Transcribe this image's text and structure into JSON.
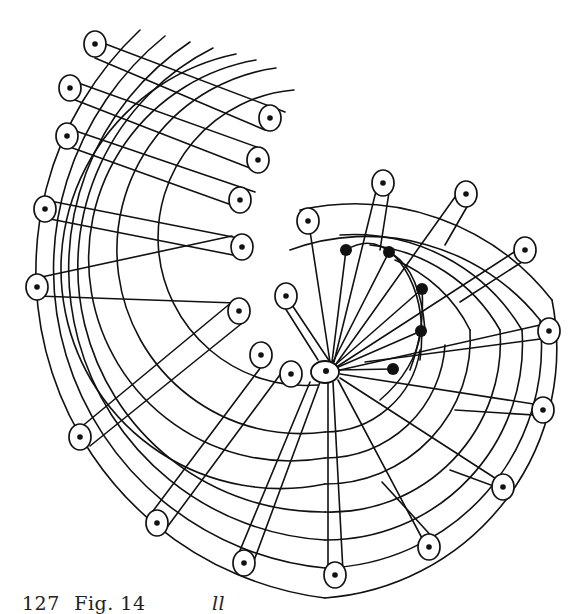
{
  "figure": {
    "stroke_color": "#111111",
    "background": "#ffffff",
    "hub": {
      "x": 325,
      "y": 372
    },
    "left_band_loops": [
      {
        "x": 95,
        "y": 44
      },
      {
        "x": 270,
        "y": 118
      },
      {
        "x": 70,
        "y": 88
      },
      {
        "x": 258,
        "y": 160
      },
      {
        "x": 67,
        "y": 136
      },
      {
        "x": 240,
        "y": 200
      },
      {
        "x": 45,
        "y": 209
      },
      {
        "x": 242,
        "y": 247
      },
      {
        "x": 37,
        "y": 287
      },
      {
        "x": 239,
        "y": 311
      },
      {
        "x": 261,
        "y": 355
      },
      {
        "x": 291,
        "y": 374
      }
    ],
    "radial_loops": [
      {
        "x": 80,
        "y": 437
      },
      {
        "x": 157,
        "y": 523
      },
      {
        "x": 244,
        "y": 563
      },
      {
        "x": 335,
        "y": 575
      },
      {
        "x": 429,
        "y": 547
      },
      {
        "x": 503,
        "y": 487
      },
      {
        "x": 543,
        "y": 410
      },
      {
        "x": 549,
        "y": 331
      },
      {
        "x": 525,
        "y": 250
      },
      {
        "x": 466,
        "y": 194
      },
      {
        "x": 383,
        "y": 183
      },
      {
        "x": 308,
        "y": 221
      },
      {
        "x": 286,
        "y": 296
      }
    ],
    "inner_dots": [
      {
        "x": 346,
        "y": 250
      },
      {
        "x": 389,
        "y": 252
      },
      {
        "x": 422,
        "y": 289
      },
      {
        "x": 421,
        "y": 331
      },
      {
        "x": 393,
        "y": 369
      }
    ]
  },
  "caption": {
    "number": "127",
    "label": "Fig. 14",
    "fragment": "ll"
  }
}
